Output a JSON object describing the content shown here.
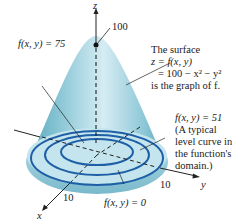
{
  "figure": {
    "axes": {
      "z_label": "z",
      "x_label": "x",
      "y_label": "y",
      "z_peak_value": "100",
      "x_tick": "10",
      "y_tick": "10"
    },
    "annotations": {
      "level_75": "f(x, y) = 75",
      "level_51": "f(x, y) = 51",
      "level_0": "f(x, y) = 0",
      "surface_line1": "The surface",
      "surface_line2": "z = f(x, y)",
      "surface_line3": "= 100 − x² − y²",
      "surface_line4": "is the graph of f.",
      "typical_line1": "(A typical",
      "typical_line2": "level curve in",
      "typical_line3": "the function's",
      "typical_line4": "domain.)"
    },
    "colors": {
      "surface_light": "#d9eef4",
      "surface_mid": "#9ccfdd",
      "surface_dark": "#5aaabf",
      "level_curve": "#1f5fa8",
      "axis": "#222222"
    }
  }
}
